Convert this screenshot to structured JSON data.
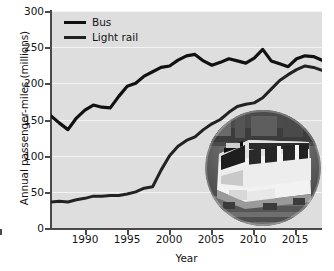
{
  "chart_data": {
    "type": "line",
    "title": "",
    "xlabel": "Year",
    "ylabel": "Annual passenger-miles (millions)",
    "xlim": [
      1986,
      2018
    ],
    "ylim": [
      0,
      300
    ],
    "xticks": [
      1990,
      1995,
      2000,
      2005,
      2010,
      2015
    ],
    "yticks": [
      0,
      50,
      100,
      150,
      200,
      250,
      300
    ],
    "grid": "horizontal",
    "legend_position": "top-left",
    "plot_background": "#dedede",
    "gridline_color": "#f4f4f4",
    "x": [
      1986,
      1987,
      1988,
      1989,
      1990,
      1991,
      1992,
      1993,
      1994,
      1995,
      1996,
      1997,
      1998,
      1999,
      2000,
      2001,
      2002,
      2003,
      2004,
      2005,
      2006,
      2007,
      2008,
      2009,
      2010,
      2011,
      2012,
      2013,
      2014,
      2015,
      2016,
      2017,
      2018
    ],
    "series": [
      {
        "name": "Bus",
        "color": "#111111",
        "width": 3.2,
        "values": [
          155,
          145,
          136,
          152,
          163,
          170,
          167,
          166,
          182,
          196,
          200,
          210,
          216,
          222,
          224,
          232,
          238,
          240,
          231,
          225,
          229,
          234,
          231,
          228,
          235,
          247,
          231,
          227,
          223,
          234,
          238,
          237,
          232
        ]
      },
      {
        "name": "Light rail",
        "color": "#222222",
        "width": 3.0,
        "values": [
          36,
          37,
          36,
          39,
          41,
          44,
          44,
          45,
          45,
          47,
          50,
          55,
          57,
          80,
          100,
          113,
          121,
          126,
          136,
          144,
          150,
          160,
          168,
          171,
          173,
          180,
          192,
          204,
          212,
          219,
          224,
          222,
          218
        ]
      }
    ],
    "legend": [
      {
        "label": "Bus"
      },
      {
        "label": "Light rail"
      }
    ],
    "annotations": [
      {
        "name": "light-rail-train-photo",
        "type": "inset-image",
        "shape": "circle",
        "description": "Photograph of a light rail train"
      }
    ]
  }
}
